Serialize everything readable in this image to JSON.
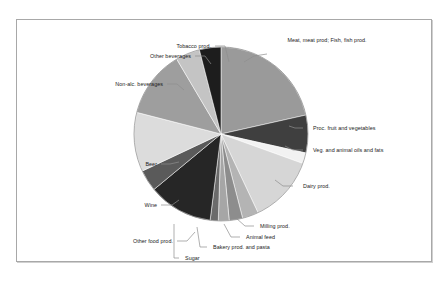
{
  "chart_data": {
    "type": "pie",
    "title": "",
    "subtitle": "",
    "xlabel": "",
    "ylabel": "",
    "legend_position": "none",
    "grid": false,
    "labels_position": "outside-with-leader-lines",
    "start_angle_deg": 0,
    "direction": "clockwise",
    "categories": [
      "Meat, meat prod; Fish, fish prod.",
      "Proc. fruit and vegetables",
      "Veg. and animal oils and fats",
      "Dairy prod.",
      "Milling prod.",
      "Animal feed",
      "Bakery prod. and pasta",
      "Sugar",
      "Other food prod.",
      "Wine",
      "Beer",
      "Non-alc. beverages",
      "Other beverages",
      "Tobacco prod."
    ],
    "values": [
      21.5,
      7.0,
      2.0,
      12.5,
      3.0,
      2.5,
      2.0,
      1.5,
      12.0,
      4.0,
      11.0,
      12.5,
      4.5,
      4.0
    ],
    "colors": [
      "#9a9a9a",
      "#3f3f3f",
      "#f2f2f2",
      "#d6d6d6",
      "#b4b4b4",
      "#8d8d8d",
      "#a6a6a6",
      "#6b6b6b",
      "#262626",
      "#5a5a5a",
      "#dcdcdc",
      "#9e9e9e",
      "#c4c4c4",
      "#1d1d1d"
    ],
    "slices": [
      {
        "label": "Meat, meat prod; Fish, fish prod.",
        "value": 21.5,
        "color": "#9a9a9a"
      },
      {
        "label": "Proc. fruit and vegetables",
        "value": 7.0,
        "color": "#3f3f3f"
      },
      {
        "label": "Veg. and animal oils and fats",
        "value": 2.0,
        "color": "#f2f2f2"
      },
      {
        "label": "Dairy prod.",
        "value": 12.5,
        "color": "#d6d6d6"
      },
      {
        "label": "Milling prod.",
        "value": 3.0,
        "color": "#b4b4b4"
      },
      {
        "label": "Animal feed",
        "value": 2.5,
        "color": "#8d8d8d"
      },
      {
        "label": "Bakery prod. and pasta",
        "value": 2.0,
        "color": "#a6a6a6"
      },
      {
        "label": "Sugar",
        "value": 1.5,
        "color": "#6b6b6b"
      },
      {
        "label": "Other food prod.",
        "value": 12.0,
        "color": "#262626"
      },
      {
        "label": "Wine",
        "value": 4.0,
        "color": "#5a5a5a"
      },
      {
        "label": "Beer",
        "value": 11.0,
        "color": "#dcdcdc"
      },
      {
        "label": "Non-alc. beverages",
        "value": 12.5,
        "color": "#9e9e9e"
      },
      {
        "label": "Other beverages",
        "value": 4.5,
        "color": "#c4c4c4"
      },
      {
        "label": "Tobacco prod.",
        "value": 4.0,
        "color": "#1d1d1d"
      }
    ]
  },
  "chart": {
    "geometry": {
      "cx": 204,
      "cy": 114,
      "r": 87
    },
    "label_layout": [
      {
        "key": "meat",
        "x": 262,
        "y": 17,
        "w": 96,
        "align": "center",
        "wrap": true,
        "leader": [
          [
            250,
            34
          ],
          [
            237,
            36
          ],
          [
            227,
            42
          ]
        ]
      },
      {
        "key": "procfruit",
        "x": 296,
        "y": 105,
        "w": 120,
        "align": "left",
        "leader": [
          [
            286,
            108
          ],
          [
            278,
            108
          ],
          [
            272,
            106
          ]
        ]
      },
      {
        "key": "vegoils",
        "x": 296,
        "y": 127,
        "w": 120,
        "align": "left",
        "leader": [
          [
            286,
            130
          ],
          [
            276,
            130
          ],
          [
            268,
            126
          ]
        ]
      },
      {
        "key": "dairy",
        "x": 286,
        "y": 163,
        "w": 110,
        "align": "left",
        "leader": [
          [
            276,
            166
          ],
          [
            266,
            166
          ],
          [
            258,
            160
          ]
        ]
      },
      {
        "key": "milling",
        "x": 243,
        "y": 203,
        "w": 100,
        "align": "left",
        "leader": [
          [
            237,
            206
          ],
          [
            228,
            206
          ],
          [
            219,
            198
          ]
        ]
      },
      {
        "key": "animfeed",
        "x": 229,
        "y": 214,
        "w": 100,
        "align": "left",
        "leader": [
          [
            223,
            217
          ],
          [
            214,
            217
          ],
          [
            207,
            204
          ]
        ]
      },
      {
        "key": "bakery",
        "x": 196,
        "y": 224,
        "w": 120,
        "align": "left",
        "leader": [
          [
            190,
            227
          ],
          [
            183,
            227
          ],
          [
            180,
            207
          ]
        ]
      },
      {
        "key": "sugar",
        "x": 168,
        "y": 235,
        "w": 80,
        "align": "left",
        "leader": [
          [
            162,
            238
          ],
          [
            157,
            238
          ],
          [
            157,
            204
          ]
        ]
      },
      {
        "key": "otherfood",
        "x": 46,
        "y": 218,
        "w": 110,
        "align": "right",
        "leader": [
          [
            160,
            221
          ],
          [
            170,
            221
          ],
          [
            178,
            212
          ]
        ]
      },
      {
        "key": "wine",
        "x": 50,
        "y": 182,
        "w": 90,
        "align": "right",
        "leader": [
          [
            144,
            185
          ],
          [
            155,
            185
          ],
          [
            162,
            180
          ]
        ]
      },
      {
        "key": "beer",
        "x": 50,
        "y": 141,
        "w": 90,
        "align": "right",
        "leader": [
          [
            144,
            144
          ],
          [
            153,
            144
          ],
          [
            162,
            142
          ]
        ]
      },
      {
        "key": "nonalc",
        "x": 36,
        "y": 61,
        "w": 110,
        "align": "right",
        "leader": [
          [
            150,
            64
          ],
          [
            160,
            64
          ],
          [
            167,
            70
          ]
        ]
      },
      {
        "key": "otherbev",
        "x": 84,
        "y": 33,
        "w": 90,
        "align": "right",
        "leader": [
          [
            178,
            36
          ],
          [
            188,
            36
          ],
          [
            194,
            44
          ]
        ]
      },
      {
        "key": "tobacco",
        "x": 104,
        "y": 23,
        "w": 90,
        "align": "right",
        "leader": [
          [
            198,
            26
          ],
          [
            208,
            26
          ],
          [
            212,
            42
          ]
        ]
      }
    ]
  }
}
